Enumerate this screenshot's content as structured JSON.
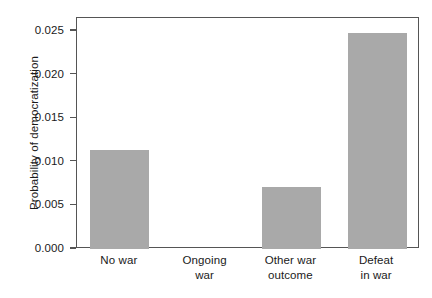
{
  "chart_data": {
    "type": "bar",
    "title": "",
    "xlabel": "",
    "ylabel": "Probability of democratization",
    "categories": [
      "No war",
      "Ongoing war",
      "Other war outcome",
      "Defeat in war"
    ],
    "category_lines": [
      [
        "No war"
      ],
      [
        "Ongoing",
        "war"
      ],
      [
        "Other war",
        "outcome"
      ],
      [
        "Defeat",
        "in war"
      ]
    ],
    "values": [
      0.0113,
      0.0,
      0.0071,
      0.0248
    ],
    "ylim": [
      0.0,
      0.0265
    ],
    "yticks": [
      0.0,
      0.005,
      0.01,
      0.015,
      0.02,
      0.025
    ],
    "ytick_labels": [
      "0.000",
      "0.005",
      "0.010",
      "0.015",
      "0.020",
      "0.025"
    ],
    "grid": false,
    "legend": false,
    "bar_color": "#a9a9a9",
    "axis_color": "#555555"
  }
}
